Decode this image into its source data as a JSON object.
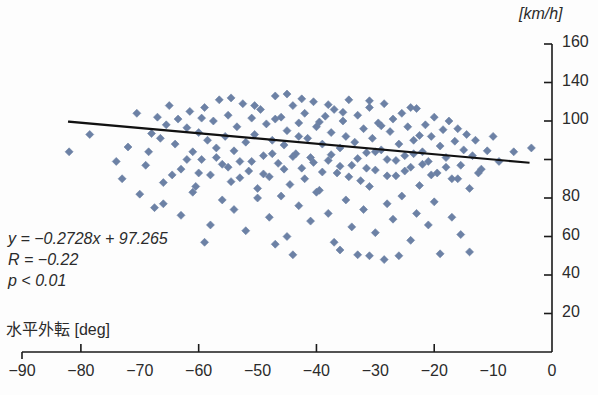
{
  "chart_data": {
    "type": "scatter",
    "title": "",
    "xlabel": "水平外転 [deg]",
    "ylabel": "[km/h]",
    "xlim": [
      -90,
      0
    ],
    "ylim": [
      0,
      160
    ],
    "grid": false,
    "legend": "none",
    "marker": {
      "shape": "diamond",
      "color": "#6c81a5",
      "size": 8
    },
    "xticks": [
      -90,
      -80,
      -70,
      -60,
      -50,
      -40,
      -30,
      -20,
      -10,
      0
    ],
    "xtick_labels": [
      "-90",
      "-80",
      "-70",
      "-60",
      "-50",
      "-40",
      "-30",
      "-20",
      "-10",
      "0"
    ],
    "yticks": [
      20,
      40,
      60,
      80,
      100,
      140,
      160
    ],
    "ytick_labels": [
      "20",
      "40",
      "60",
      "80",
      "100",
      "140",
      "160"
    ],
    "fit_line": {
      "slope": -0.2728,
      "intercept": 97.265,
      "x_start": -82,
      "x_end": -4,
      "color": "#111111",
      "width": 2.2
    },
    "annotations": {
      "equation": "y = −0.2728x + 97.265",
      "correlation": "R = −0.22",
      "pvalue": "p < 0.01"
    },
    "points": [
      [
        -82.0,
        104.0
      ],
      [
        -78.5,
        113.0
      ],
      [
        -74.0,
        99.0
      ],
      [
        -72.0,
        106.5
      ],
      [
        -70.5,
        124.0
      ],
      [
        -69.0,
        97.0
      ],
      [
        -68.0,
        113.5
      ],
      [
        -67.0,
        122.0
      ],
      [
        -66.0,
        88.0
      ],
      [
        -65.5,
        118.0
      ],
      [
        -65.0,
        128.0
      ],
      [
        -64.0,
        108.0
      ],
      [
        -63.5,
        121.0
      ],
      [
        -63.0,
        95.0
      ],
      [
        -62.0,
        116.5
      ],
      [
        -61.5,
        125.0
      ],
      [
        -61.0,
        104.0
      ],
      [
        -60.5,
        86.0
      ],
      [
        -60.0,
        114.0
      ],
      [
        -59.5,
        100.0
      ],
      [
        -59.0,
        127.0
      ],
      [
        -58.5,
        110.0
      ],
      [
        -58.0,
        92.0
      ],
      [
        -57.5,
        120.0
      ],
      [
        -57.0,
        106.0
      ],
      [
        -56.5,
        131.0
      ],
      [
        -56.0,
        97.5
      ],
      [
        -55.5,
        112.0
      ],
      [
        -55.0,
        123.0
      ],
      [
        -54.5,
        88.5
      ],
      [
        -54.0,
        104.5
      ],
      [
        -53.5,
        117.0
      ],
      [
        -53.0,
        99.0
      ],
      [
        -52.5,
        129.0
      ],
      [
        -52.0,
        109.0
      ],
      [
        -51.5,
        94.0
      ],
      [
        -51.0,
        121.5
      ],
      [
        -50.5,
        113.0
      ],
      [
        -50.0,
        80.0
      ],
      [
        -49.5,
        126.0
      ],
      [
        -49.0,
        102.0
      ],
      [
        -48.5,
        118.5
      ],
      [
        -48.0,
        91.0
      ],
      [
        -47.5,
        110.0
      ],
      [
        -47.0,
        133.0
      ],
      [
        -46.5,
        98.0
      ],
      [
        -46.0,
        122.0
      ],
      [
        -45.5,
        107.5
      ],
      [
        -45.0,
        115.0
      ],
      [
        -44.5,
        87.0
      ],
      [
        -44.0,
        128.0
      ],
      [
        -43.5,
        103.0
      ],
      [
        -43.0,
        119.0
      ],
      [
        -42.5,
        95.5
      ],
      [
        -42.0,
        124.0
      ],
      [
        -41.5,
        111.0
      ],
      [
        -41.0,
        101.0
      ],
      [
        -40.5,
        130.0
      ],
      [
        -40.0,
        117.0
      ],
      [
        -39.5,
        84.0
      ],
      [
        -39.0,
        108.0
      ],
      [
        -38.5,
        122.5
      ],
      [
        -38.0,
        99.5
      ],
      [
        -37.5,
        114.0
      ],
      [
        -37.0,
        126.0
      ],
      [
        -36.5,
        93.0
      ],
      [
        -36.0,
        106.0
      ],
      [
        -35.5,
        120.0
      ],
      [
        -35.0,
        112.0
      ],
      [
        -34.5,
        131.0
      ],
      [
        -34.0,
        97.0
      ],
      [
        -33.5,
        109.0
      ],
      [
        -33.0,
        123.0
      ],
      [
        -32.5,
        89.0
      ],
      [
        -32.0,
        116.0
      ],
      [
        -31.5,
        103.5
      ],
      [
        -31.0,
        127.0
      ],
      [
        -30.5,
        111.0
      ],
      [
        -30.0,
        94.5
      ],
      [
        -29.5,
        119.0
      ],
      [
        -29.0,
        105.0
      ],
      [
        -28.5,
        129.0
      ],
      [
        -28.0,
        100.0
      ],
      [
        -27.5,
        114.5
      ],
      [
        -27.0,
        121.0
      ],
      [
        -26.5,
        91.5
      ],
      [
        -26.0,
        108.0
      ],
      [
        -25.5,
        124.0
      ],
      [
        -25.0,
        102.0
      ],
      [
        -24.5,
        117.0
      ],
      [
        -24.0,
        96.0
      ],
      [
        -23.5,
        110.0
      ],
      [
        -23.0,
        126.5
      ],
      [
        -22.5,
        86.5
      ],
      [
        -22.0,
        104.0
      ],
      [
        -21.5,
        118.0
      ],
      [
        -21.0,
        99.0
      ],
      [
        -20.5,
        112.0
      ],
      [
        -20.0,
        122.0
      ],
      [
        -19.5,
        93.0
      ],
      [
        -19.0,
        107.0
      ],
      [
        -18.5,
        115.5
      ],
      [
        -18.0,
        101.0
      ],
      [
        -17.5,
        120.0
      ],
      [
        -17.0,
        90.0
      ],
      [
        -16.5,
        109.5
      ],
      [
        -16.0,
        116.0
      ],
      [
        -15.5,
        97.0
      ],
      [
        -15.0,
        105.0
      ],
      [
        -14.5,
        113.0
      ],
      [
        -14.0,
        85.0
      ],
      [
        -13.5,
        102.0
      ],
      [
        -13.0,
        110.0
      ],
      [
        -12.0,
        95.0
      ],
      [
        -11.0,
        104.5
      ],
      [
        -10.0,
        112.0
      ],
      [
        -9.0,
        99.0
      ],
      [
        -6.5,
        104.0
      ],
      [
        -3.5,
        106.0
      ],
      [
        -66.0,
        77.0
      ],
      [
        -63.0,
        71.0
      ],
      [
        -61.0,
        83.0
      ],
      [
        -58.0,
        66.0
      ],
      [
        -56.0,
        79.0
      ],
      [
        -54.0,
        74.0
      ],
      [
        -52.0,
        63.0
      ],
      [
        -50.0,
        85.0
      ],
      [
        -48.0,
        70.0
      ],
      [
        -46.0,
        81.0
      ],
      [
        -45.0,
        60.0
      ],
      [
        -43.0,
        76.0
      ],
      [
        -41.0,
        68.0
      ],
      [
        -40.0,
        83.0
      ],
      [
        -38.0,
        72.0
      ],
      [
        -37.0,
        57.0
      ],
      [
        -35.0,
        79.0
      ],
      [
        -34.0,
        65.0
      ],
      [
        -32.0,
        74.0
      ],
      [
        -31.0,
        86.0
      ],
      [
        -30.0,
        62.0
      ],
      [
        -28.0,
        77.0
      ],
      [
        -27.0,
        69.0
      ],
      [
        -25.5,
        81.0
      ],
      [
        -24.0,
        58.0
      ],
      [
        -23.0,
        72.0
      ],
      [
        -21.0,
        66.0
      ],
      [
        -20.0,
        78.0
      ],
      [
        -19.0,
        51.0
      ],
      [
        -17.0,
        70.0
      ],
      [
        -15.5,
        61.0
      ],
      [
        -14.0,
        52.0
      ],
      [
        -33.0,
        50.5
      ],
      [
        -31.0,
        50.0
      ],
      [
        -28.5,
        48.0
      ],
      [
        -26.0,
        50.0
      ],
      [
        -36.0,
        53.0
      ],
      [
        -44.0,
        50.5
      ],
      [
        -47.0,
        56.0
      ],
      [
        -59.0,
        57.0
      ],
      [
        -70.0,
        82.0
      ],
      [
        -73.0,
        90.0
      ],
      [
        -67.5,
        75.0
      ],
      [
        -64.5,
        92.0
      ],
      [
        -62.0,
        100.0
      ],
      [
        -60.0,
        93.0
      ],
      [
        -57.0,
        101.0
      ],
      [
        -55.0,
        96.0
      ],
      [
        -53.0,
        90.5
      ],
      [
        -51.0,
        99.0
      ],
      [
        -49.0,
        92.5
      ],
      [
        -47.5,
        103.0
      ],
      [
        -45.5,
        95.0
      ],
      [
        -44.0,
        101.5
      ],
      [
        -42.0,
        90.0
      ],
      [
        -40.5,
        98.5
      ],
      [
        -39.0,
        93.5
      ],
      [
        -37.5,
        102.5
      ],
      [
        -36.0,
        96.5
      ],
      [
        -34.5,
        91.0
      ],
      [
        -33.0,
        100.5
      ],
      [
        -31.5,
        95.5
      ],
      [
        -30.0,
        104.0
      ],
      [
        -28.0,
        91.5
      ],
      [
        -26.5,
        99.5
      ],
      [
        -25.0,
        94.0
      ],
      [
        -23.5,
        103.0
      ],
      [
        -22.0,
        97.5
      ],
      [
        -20.5,
        92.0
      ],
      [
        -18.0,
        96.0
      ],
      [
        -16.0,
        90.0
      ],
      [
        -12.5,
        93.0
      ],
      [
        -68.5,
        104.0
      ],
      [
        -66.5,
        111.0
      ],
      [
        -59.5,
        121.5
      ],
      [
        -50.5,
        128.0
      ],
      [
        -42.5,
        131.5
      ],
      [
        -38.0,
        128.5
      ],
      [
        -31.0,
        130.5
      ],
      [
        -24.0,
        127.0
      ],
      [
        -47.0,
        121.0
      ],
      [
        -43.0,
        112.0
      ],
      [
        -39.5,
        119.5
      ],
      [
        -35.5,
        124.5
      ],
      [
        -29.0,
        117.5
      ],
      [
        -22.5,
        112.5
      ],
      [
        -54.5,
        132.0
      ],
      [
        -45.0,
        134.0
      ]
    ]
  }
}
